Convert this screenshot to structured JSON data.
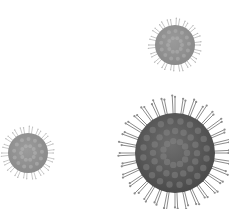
{
  "image": {
    "description": "Three grayscale spiky virus particles on a white background",
    "background_color": "#ffffff"
  },
  "particles": [
    {
      "id": "virus-top-right",
      "cx": 175,
      "cy": 45,
      "radius": 20,
      "spike_length": 7,
      "spike_count": 36,
      "body_color": "#9a9a9a",
      "spike_color": "#b8b8b8",
      "shade_color": "#8a8a8a"
    },
    {
      "id": "virus-bottom-right-large",
      "cx": 175,
      "cy": 153,
      "radius": 40,
      "spike_length": 18,
      "spike_count": 64,
      "body_color": "#6e6e6e",
      "spike_color": "#8c8c8c",
      "shade_color": "#4a4a4a"
    },
    {
      "id": "virus-bottom-left",
      "cx": 28,
      "cy": 153,
      "radius": 20,
      "spike_length": 7,
      "spike_count": 36,
      "body_color": "#9c9c9c",
      "spike_color": "#bdbdbd",
      "shade_color": "#8a8a8a"
    }
  ]
}
